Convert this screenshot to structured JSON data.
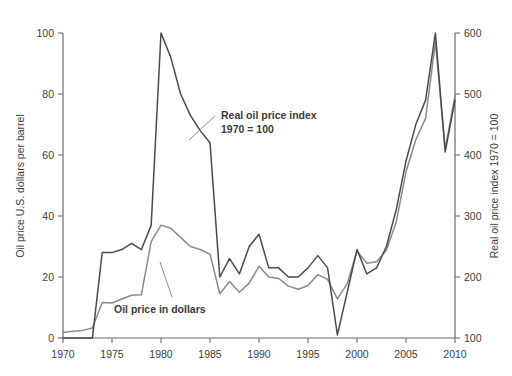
{
  "chart_data": {
    "type": "line",
    "title": "",
    "xlabel": "",
    "x": [
      1970,
      1971,
      1972,
      1973,
      1974,
      1975,
      1976,
      1977,
      1978,
      1979,
      1980,
      1981,
      1982,
      1983,
      1984,
      1985,
      1986,
      1987,
      1988,
      1989,
      1990,
      1991,
      1992,
      1993,
      1994,
      1995,
      1996,
      1997,
      1998,
      1999,
      2000,
      2001,
      2002,
      2003,
      2004,
      2005,
      2006,
      2007,
      2008,
      2009,
      2010
    ],
    "xlim": [
      1970,
      2010
    ],
    "xticks": [
      1970,
      1975,
      1980,
      1985,
      1990,
      1995,
      2000,
      2005,
      2010
    ],
    "xticklabels": [
      "1970",
      "1975",
      "1980",
      "1985",
      "1990",
      "1995",
      "2000",
      "2005",
      "2010"
    ],
    "grid": false,
    "legend": "inline-annotations",
    "left_axis": {
      "label": "Oil price U.S. dollars per barrel",
      "ylim": [
        0,
        100
      ],
      "yticks": [
        0,
        20,
        40,
        60,
        80,
        100
      ],
      "yticklabels": [
        "0",
        "20",
        "40",
        "60",
        "80",
        "100"
      ]
    },
    "right_axis": {
      "label": "Real oil price index 1970 = 100",
      "ylim": [
        100,
        600
      ],
      "yticks": [
        100,
        200,
        300,
        400,
        500,
        600
      ],
      "yticklabels": [
        "100",
        "200",
        "300",
        "400",
        "500",
        "600"
      ]
    },
    "series": [
      {
        "name": "Real oil price index 1970 = 100",
        "axis": "right",
        "color": "#4a4a4a",
        "annotation": "Real oil price index\n1970 = 100",
        "values": [
          100,
          100,
          100,
          100,
          240,
          240,
          245,
          255,
          245,
          285,
          600,
          560,
          500,
          465,
          440,
          420,
          200,
          230,
          205,
          250,
          270,
          215,
          215,
          200,
          200,
          215,
          235,
          215,
          105,
          175,
          245,
          205,
          215,
          250,
          310,
          390,
          450,
          490,
          600,
          405,
          490
        ]
      },
      {
        "name": "Oil price in dollars",
        "axis": "left",
        "color": "#8a8a8a",
        "annotation": "Oil price in dollars",
        "values": [
          1.8,
          2.2,
          2.5,
          3.3,
          11.6,
          11.5,
          12.8,
          14.0,
          14.2,
          31.6,
          37.0,
          36.0,
          33.0,
          30.0,
          29.0,
          27.5,
          14.5,
          18.5,
          15.0,
          18.0,
          23.5,
          20.0,
          19.5,
          17.0,
          16.0,
          17.2,
          20.8,
          19.2,
          12.8,
          17.8,
          28.5,
          24.5,
          25.0,
          28.8,
          38.0,
          54.5,
          65.0,
          72.0,
          97.0,
          62.0,
          79.5
        ]
      }
    ],
    "annotations": [
      {
        "name": "real-oil-price-index-label",
        "line1": "Real oil price index",
        "line2": "1970 = 100"
      },
      {
        "name": "oil-price-in-dollars-label",
        "text": "Oil price in dollars"
      }
    ]
  }
}
